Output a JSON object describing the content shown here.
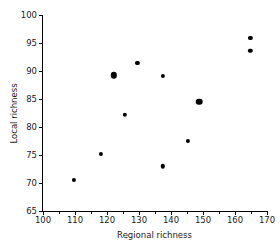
{
  "chart_data": {
    "type": "scatter",
    "title": "",
    "xlabel": "Regional richness",
    "ylabel": "Local richness",
    "xlim": [
      100,
      170
    ],
    "ylim": [
      65,
      100
    ],
    "xticks": [
      100,
      110,
      120,
      130,
      140,
      150,
      160,
      170
    ],
    "yticks": [
      65,
      70,
      75,
      80,
      85,
      90,
      95,
      100
    ],
    "xtick_labels": [
      "100",
      "110",
      "120",
      "130",
      "140",
      "150",
      "160",
      "170"
    ],
    "ytick_labels": [
      "65",
      "70",
      "75",
      "80",
      "85",
      "90",
      "95",
      "100"
    ],
    "grid": false,
    "legend": null,
    "marker_color": "#000000",
    "points": [
      {
        "x": 109.7,
        "y": 70.6,
        "size": 4.2
      },
      {
        "x": 118.0,
        "y": 75.2,
        "size": 4.2
      },
      {
        "x": 122.1,
        "y": 89.2,
        "size": 6.4
      },
      {
        "x": 125.5,
        "y": 82.2,
        "size": 4.4
      },
      {
        "x": 129.5,
        "y": 91.4,
        "size": 4.2
      },
      {
        "x": 137.4,
        "y": 73.0,
        "size": 4.4
      },
      {
        "x": 137.5,
        "y": 89.1,
        "size": 4.2
      },
      {
        "x": 145.4,
        "y": 77.5,
        "size": 4.2
      },
      {
        "x": 148.9,
        "y": 84.5,
        "size": 6.6
      },
      {
        "x": 164.8,
        "y": 95.9,
        "size": 4.2
      },
      {
        "x": 164.8,
        "y": 93.6,
        "size": 4.4
      }
    ]
  }
}
